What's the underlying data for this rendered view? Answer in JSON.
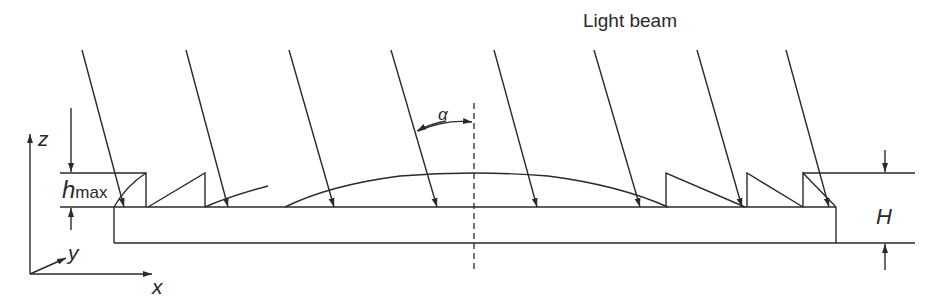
{
  "title": "Light beam",
  "labels": {
    "light_beam": "Light beam",
    "angle": "α",
    "h_symbol": "h",
    "h_subscript": "max",
    "H": "H",
    "axis_z": "z",
    "axis_y": "y",
    "axis_x": "x"
  },
  "colors": {
    "ink": "#2a2a2a",
    "background": "#ffffff"
  },
  "elements": {
    "light_rays_count": 8,
    "left_sawtooth_count": 3,
    "right_sawtooth_count": 3,
    "central_lens": "convex arc",
    "substrate": "rectangular plate"
  }
}
